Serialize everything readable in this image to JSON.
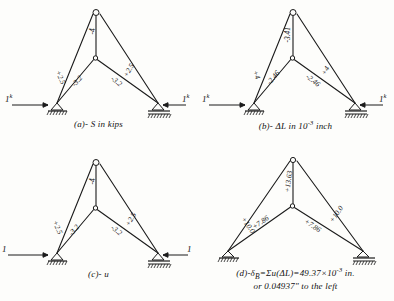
{
  "figure": {
    "ink_color": "#1b1b1b",
    "paper_color": "#fdfdfb"
  },
  "panels": [
    {
      "id": "a",
      "caption_html": "(a)- S in kips",
      "caption_plain": "(a)- S in kips",
      "members": {
        "left_top": "+2.5",
        "right_top": "+2.5",
        "left_bottom": "-3.2",
        "right_bottom": "-3.2",
        "vertical": "-4"
      },
      "loads": {
        "left": "1",
        "left_sup": "k",
        "right": "1",
        "right_sup": "k"
      },
      "supports": {
        "left": "pin-support",
        "right": "pin-support"
      }
    },
    {
      "id": "b",
      "caption_html": "(b)- &#916;L in 10<sup>-3</sup> inch",
      "caption_plain": "(b)- ΔL in 10-3 inch",
      "members": {
        "left_top": "+4",
        "right_top": "+4",
        "left_bottom": "-2.46",
        "right_bottom": "-2.46",
        "vertical": "-3.41"
      },
      "loads": {
        "left": "1",
        "left_sup": "k",
        "right": "1",
        "right_sup": "k"
      },
      "supports": {
        "left": "pin-support",
        "right": "pin-support"
      }
    },
    {
      "id": "c",
      "caption_html": "(c)- u",
      "caption_plain": "(c)- u",
      "members": {
        "left_top": "+2.5",
        "right_top": "+2.5",
        "left_bottom": "-3.2",
        "right_bottom": "-3.2",
        "vertical": "-4"
      },
      "loads": {
        "left": "1",
        "left_sup": "",
        "right": "1",
        "right_sup": ""
      },
      "supports": {
        "left": "pin-support",
        "right": "pin-support"
      }
    },
    {
      "id": "d",
      "caption_html": "(d)-&#948;<sub>B</sub>=&#931;u(&#916;L)=49.37&#215;10<sup>-3</sup> in.",
      "caption_plain": "(d)-δB=Σu(ΔL)=49.37x10-3 in.",
      "caption_line2": "or 0.04937\" to the left",
      "members": {
        "left_top": "+10.0",
        "right_top": "+10.0",
        "left_bottom": "+7.86",
        "right_bottom": "+7.86",
        "vertical": "+13.63"
      },
      "loads": {
        "left": "",
        "left_sup": "",
        "right": "",
        "right_sup": ""
      },
      "supports": {
        "left": "pin-support",
        "right": "pin-support"
      }
    }
  ]
}
